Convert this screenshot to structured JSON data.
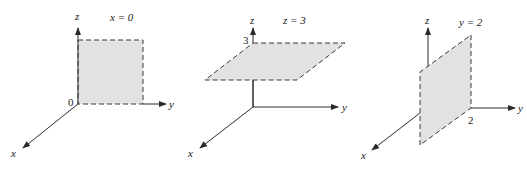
{
  "panels": [
    {
      "title": "x = 0",
      "axes": {
        "x": "x",
        "y": "y",
        "z": "z"
      },
      "tick_label": "0",
      "description": "Plane x=0 (yz-plane) shaded square"
    },
    {
      "title": "z = 3",
      "axes": {
        "x": "x",
        "y": "y",
        "z": "z"
      },
      "tick_label": "3",
      "description": "Horizontal plane at z=3"
    },
    {
      "title": "y = 2",
      "axes": {
        "x": "x",
        "y": "y",
        "z": "z"
      },
      "tick_label": "2",
      "description": "Vertical plane at y=2"
    }
  ],
  "colors": {
    "plane_fill": "#e2e2e2",
    "axis": "#2a2a2a"
  }
}
